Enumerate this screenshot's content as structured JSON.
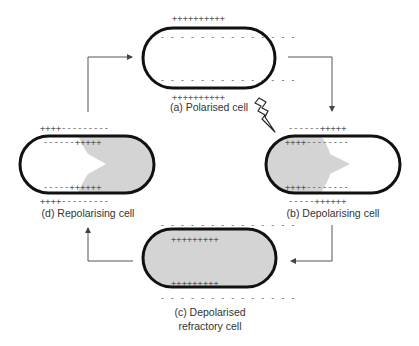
{
  "diagram": {
    "cells": [
      {
        "id": "a",
        "label": "(a) Polarised cell",
        "outer_top": "++++++++++",
        "inner_top": "- - - - - - - - - - - - - -",
        "inner_bottom": "- - - - - - - - - - - - - -",
        "outer_bottom": "++++++++++",
        "fill": "none"
      },
      {
        "id": "b",
        "label": "(b) Depolarising cell",
        "outer_top": "------+++++",
        "inner_top": "++++--------",
        "inner_bottom": "++++--------",
        "outer_bottom": "-----++++++",
        "fill": "partial-left"
      },
      {
        "id": "c",
        "label_line1": "(c) Depolarised",
        "label_line2": "refractory cell",
        "outer_top": "- - - - - - - - - - - - - -",
        "inner_top": "+++++++++",
        "inner_bottom": "+++++++++",
        "outer_bottom": "- - - - - - - - - - - - - -",
        "fill": "full"
      },
      {
        "id": "d",
        "label": "(d) Repolarising cell",
        "outer_top": "++++---------",
        "inner_top": "------+++++",
        "inner_bottom": "-----++++++",
        "outer_bottom": "++++---------",
        "fill": "partial-right"
      }
    ],
    "stimulus_icon": "lightning-bolt",
    "arrows": [
      "d-to-a",
      "a-to-b",
      "b-to-c",
      "c-to-d"
    ],
    "colors": {
      "membrane": "#111111",
      "depolarised_fill": "#d4d4d4",
      "arrow": "#555555",
      "text": "#333333"
    }
  }
}
